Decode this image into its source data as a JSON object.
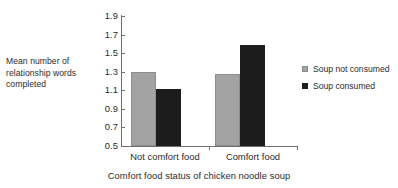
{
  "chart_data": {
    "type": "bar",
    "title": "",
    "xlabel": "Comfort food status of chicken noodle soup",
    "ylabel": "Mean number of relationship words completed",
    "ylabel_lines": [
      "Mean number of",
      "relationship words",
      "completed"
    ],
    "categories": [
      "Not comfort food",
      "Comfort food"
    ],
    "series": [
      {
        "name": "Soup not consumed",
        "color": "#a3a3a3",
        "values": [
          1.3,
          1.28
        ]
      },
      {
        "name": "Soup consumed",
        "color": "#1c1c1c",
        "values": [
          1.11,
          1.59
        ]
      }
    ],
    "ylim": [
      0.5,
      1.9
    ],
    "ytick_step": 0.2,
    "yticks": [
      "1.9",
      "1.7",
      "1.5",
      "1.3",
      "1.1",
      "0.9",
      "0.7",
      "0.5"
    ],
    "ytick_values": [
      1.9,
      1.7,
      1.5,
      1.3,
      1.1,
      0.9,
      0.7,
      0.5
    ],
    "grid": false,
    "legend_position": "right",
    "legend": [
      "Soup not consumed",
      "Soup consumed"
    ]
  }
}
